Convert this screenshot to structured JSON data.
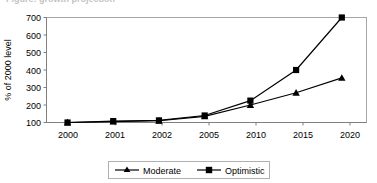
{
  "chart_data": {
    "type": "line",
    "title": "Figure: growth projection",
    "xlabel": "",
    "ylabel": "% of 2000 level",
    "categories": [
      "2000",
      "2001",
      "2002",
      "2005",
      "2010",
      "2015",
      "2020"
    ],
    "series": [
      {
        "name": "Moderate",
        "marker": "triangle",
        "values": [
          100,
          105,
          110,
          135,
          200,
          270,
          355
        ]
      },
      {
        "name": "Optimistic",
        "marker": "square",
        "values": [
          100,
          108,
          112,
          140,
          225,
          400,
          700
        ]
      }
    ],
    "ylim": [
      100,
      700
    ],
    "yticks": [
      100,
      200,
      300,
      400,
      500,
      600,
      700
    ],
    "ytick_labels": [
      "100",
      "200",
      "300",
      "400",
      "500",
      "600",
      "700"
    ],
    "grid": false,
    "legend_position": "bottom",
    "legend_entries": [
      "Moderate",
      "Optimistic"
    ]
  },
  "axis": {
    "y_title": "% of 2000 level"
  },
  "legend": {
    "moderate_label": "Moderate",
    "optimistic_label": "Optimistic"
  }
}
